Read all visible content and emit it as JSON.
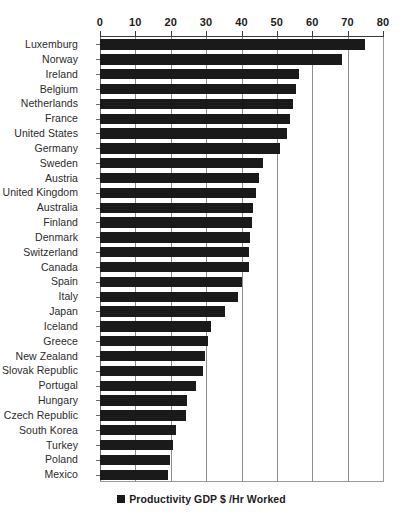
{
  "chart_data": {
    "type": "bar",
    "orientation": "horizontal",
    "title": "",
    "xlabel": "",
    "ylabel": "",
    "xlim": [
      0,
      80
    ],
    "xticks": [
      0,
      10,
      20,
      30,
      40,
      50,
      60,
      70,
      80
    ],
    "grid": true,
    "legend_position": "bottom",
    "legend": [
      "Productivity GDP $ /Hr Worked"
    ],
    "series_name": "Productivity GDP $ /Hr Worked",
    "bar_color": "#1a1a1a",
    "categories": [
      "Luxemburg",
      "Norway",
      "Ireland",
      "Belgium",
      "Netherlands",
      "France",
      "United States",
      "Germany",
      "Sweden",
      "Austria",
      "United Kingdom",
      "Australia",
      "Finland",
      "Denmark",
      "Switzerland",
      "Canada",
      "Spain",
      "Italy",
      "Japan",
      "Iceland",
      "Greece",
      "New Zealand",
      "Slovak Republic",
      "Portugal",
      "Hungary",
      "Czech Republic",
      "South Korea",
      "Turkey",
      "Poland",
      "Mexico"
    ],
    "values": [
      74.9,
      68.5,
      56.2,
      55.5,
      54.5,
      53.8,
      53.0,
      51.0,
      46.0,
      45.0,
      44.0,
      43.2,
      43.0,
      42.5,
      42.2,
      42.0,
      40.2,
      39.0,
      35.2,
      31.5,
      30.5,
      29.6,
      29.0,
      27.0,
      24.6,
      24.2,
      21.6,
      20.6,
      19.8,
      19.2
    ]
  },
  "legend": {
    "label": "Productivity GDP $ /Hr Worked"
  }
}
